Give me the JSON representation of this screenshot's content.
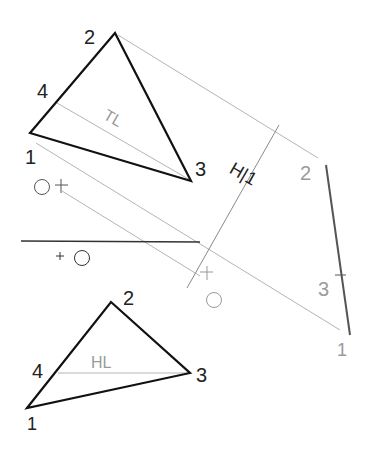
{
  "diagram": {
    "colors": {
      "object_line": "#111111",
      "projection_line": "#b5b5b5",
      "folding_line": "#8a8a8a",
      "edge_view": "#555555",
      "label_dark": "#222222",
      "label_grey": "#9a9a9a"
    },
    "front_view": {
      "points": [
        {
          "id": "1",
          "label": "1",
          "x": 30,
          "y": 133
        },
        {
          "id": "2",
          "label": "2",
          "x": 115,
          "y": 33
        },
        {
          "id": "3",
          "label": "3",
          "x": 191,
          "y": 181
        },
        {
          "id": "4",
          "label": "4",
          "x": 57,
          "y": 103
        }
      ],
      "line_label": "TL",
      "origin_label": "O+"
    },
    "top_view": {
      "points": [
        {
          "id": "1",
          "label": "1",
          "x": 27,
          "y": 408
        },
        {
          "id": "2",
          "label": "2",
          "x": 111,
          "y": 302
        },
        {
          "id": "3",
          "label": "3",
          "x": 190,
          "y": 373
        },
        {
          "id": "4",
          "label": "4",
          "x": 58,
          "y": 373
        }
      ],
      "line_label": "HL",
      "origin_label": "+O"
    },
    "folding_line_label": "H|1",
    "aux_view": {
      "points": [
        {
          "id": "2",
          "label": "2",
          "x": 328,
          "y": 168
        },
        {
          "id": "3",
          "label": "3",
          "x": 340,
          "y": 276
        },
        {
          "id": "1",
          "label": "1",
          "x": 350,
          "y": 333
        }
      ],
      "origin_label": "+O"
    }
  }
}
